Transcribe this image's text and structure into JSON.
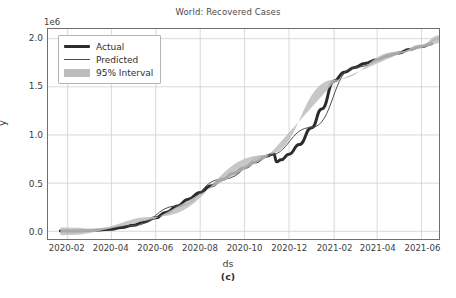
{
  "figure": {
    "title": "World: Recovered Cases",
    "xlabel": "ds",
    "ylabel": "y",
    "caption": "(c)",
    "y_offset_label": "1e6"
  },
  "legend": {
    "items": [
      {
        "label": "Actual",
        "style": "thick-line",
        "color": "#2b2b2b"
      },
      {
        "label": "Predicted",
        "style": "thin-line",
        "color": "#4d4d4d"
      },
      {
        "label": "95% Interval",
        "style": "band",
        "color": "#bdbdbd"
      }
    ]
  },
  "colors": {
    "actual": "#2b2b2b",
    "predicted": "#4d4d4d",
    "interval": "#bdbdbd",
    "grid": "#cfcfcf",
    "spine": "#6f6f6f",
    "text": "#3c3c3c",
    "background": "#ffffff"
  },
  "chart_data": {
    "type": "line",
    "title": "World: Recovered Cases",
    "xlabel": "ds",
    "ylabel": "y",
    "y_offset": "1e6",
    "grid": true,
    "legend_position": "upper left",
    "xlim": [
      "2020-01-05",
      "2021-06-25"
    ],
    "ylim": [
      -80000,
      2100000
    ],
    "xticks": [
      "2020-02",
      "2020-04",
      "2020-06",
      "2020-08",
      "2020-10",
      "2020-12",
      "2021-02",
      "2021-04",
      "2021-06"
    ],
    "yticks": [
      0.0,
      0.5,
      1.0,
      1.5,
      2.0
    ],
    "ytick_labels": [
      "0.0",
      "0.5",
      "1.0",
      "1.5",
      "2.0"
    ],
    "ytick_values": [
      0,
      500000,
      1000000,
      1500000,
      2000000
    ],
    "series": [
      {
        "name": "Actual",
        "color": "#2b2b2b",
        "linewidth": 3,
        "x": [
          "2020-01-22",
          "2020-02-15",
          "2020-03-01",
          "2020-03-15",
          "2020-04-01",
          "2020-04-15",
          "2020-05-01",
          "2020-05-15",
          "2020-06-01",
          "2020-06-15",
          "2020-07-01",
          "2020-07-15",
          "2020-08-01",
          "2020-08-15",
          "2020-09-01",
          "2020-09-15",
          "2020-10-01",
          "2020-10-15",
          "2020-11-01",
          "2020-11-10",
          "2020-11-14",
          "2020-11-20",
          "2020-12-01",
          "2020-12-15",
          "2021-01-01",
          "2021-01-15",
          "2021-02-01",
          "2021-02-15",
          "2021-03-01",
          "2021-03-15",
          "2021-04-01",
          "2021-04-15",
          "2021-05-01",
          "2021-05-15",
          "2021-06-01",
          "2021-06-15"
        ],
        "y": [
          2000,
          4000,
          7000,
          12000,
          22000,
          38000,
          62000,
          96000,
          140000,
          196000,
          262000,
          330000,
          402000,
          470000,
          540000,
          600000,
          660000,
          718000,
          782000,
          806000,
          722000,
          742000,
          800000,
          900000,
          1075000,
          1270000,
          1560000,
          1652000,
          1700000,
          1742000,
          1782000,
          1818000,
          1852000,
          1888000,
          1918000,
          1946000
        ]
      },
      {
        "name": "Predicted",
        "color": "#4d4d4d",
        "linewidth": 1,
        "x": [
          "2020-01-22",
          "2020-03-01",
          "2020-05-01",
          "2020-07-01",
          "2020-09-01",
          "2020-11-01",
          "2021-01-01",
          "2021-03-01",
          "2021-05-01",
          "2021-06-01",
          "2021-06-25"
        ],
        "y": [
          1000,
          6000,
          60000,
          264000,
          542000,
          784000,
          1078000,
          1702000,
          1854000,
          1922000,
          2000000
        ]
      },
      {
        "name": "95% Interval",
        "color": "#bdbdbd",
        "type": "band",
        "x": [
          "2020-01-22",
          "2020-02-15",
          "2020-03-01",
          "2020-06-01",
          "2020-11-01",
          "2021-02-01",
          "2021-05-01",
          "2021-06-01",
          "2021-06-25"
        ],
        "y_lower": [
          -42000,
          -36000,
          -20000,
          132000,
          772000,
          1548000,
          1840000,
          1902000,
          1958000
        ],
        "y_upper": [
          40000,
          38000,
          28000,
          150000,
          794000,
          1572000,
          1866000,
          1940000,
          2034000
        ]
      }
    ],
    "annotations": [
      {
        "text": "discontinuity / data revision drop",
        "x": "2020-11-14",
        "y_from": 806000,
        "y_to": 722000
      }
    ]
  }
}
